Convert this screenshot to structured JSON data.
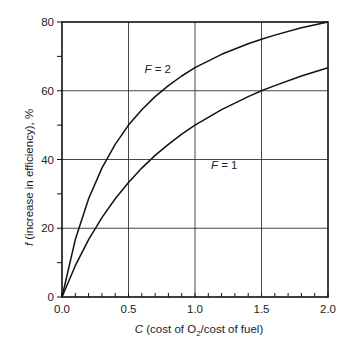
{
  "chart_data": {
    "type": "line",
    "title": "",
    "xlabel_italic": "C",
    "xlabel_rest": " (cost of O",
    "xlabel_sub": "2",
    "xlabel_end": "/cost of fuel)",
    "ylabel_italic": "f",
    "ylabel_rest": " (increase in efficiency), %",
    "xlim": [
      0,
      2.0
    ],
    "ylim": [
      0,
      80
    ],
    "x_ticks": [
      "0.0",
      "0.5",
      "1.0",
      "1.5",
      "2.0"
    ],
    "y_ticks": [
      "0",
      "20",
      "40",
      "60",
      "80"
    ],
    "grid": true,
    "series": [
      {
        "name": "F = 2",
        "label_italic": "F",
        "label_rest": " = 2",
        "x": [
          0,
          0.1,
          0.2,
          0.3,
          0.4,
          0.5,
          0.6,
          0.7,
          0.8,
          0.9,
          1.0,
          1.2,
          1.4,
          1.5,
          1.6,
          1.8,
          2.0
        ],
        "y": [
          0,
          16.7,
          28.6,
          37.5,
          44.4,
          50.0,
          54.5,
          58.3,
          61.5,
          64.3,
          66.7,
          70.6,
          73.7,
          75.0,
          76.2,
          78.3,
          80.0
        ]
      },
      {
        "name": "F = 1",
        "label_italic": "F",
        "label_rest": " = 1",
        "x": [
          0,
          0.1,
          0.2,
          0.3,
          0.4,
          0.5,
          0.6,
          0.7,
          0.8,
          0.9,
          1.0,
          1.2,
          1.4,
          1.5,
          1.6,
          1.8,
          2.0
        ],
        "y": [
          0,
          9.1,
          16.7,
          23.1,
          28.6,
          33.3,
          37.5,
          41.2,
          44.4,
          47.4,
          50.0,
          54.5,
          58.3,
          60.0,
          61.5,
          64.3,
          66.7
        ]
      }
    ]
  }
}
